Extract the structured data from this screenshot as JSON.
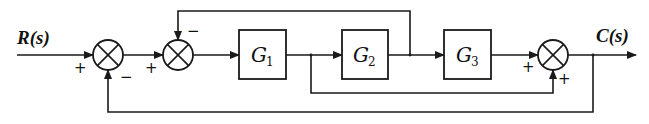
{
  "diagram": {
    "type": "control-system block diagram",
    "input_signal": "R(s)",
    "output_signal": "C(s)",
    "blocks": [
      {
        "id": "G1",
        "label": "G",
        "subscript": "1"
      },
      {
        "id": "G2",
        "label": "G",
        "subscript": "2"
      },
      {
        "id": "G3",
        "label": "G",
        "subscript": "3"
      }
    ],
    "summing_junctions": [
      {
        "id": "sum1",
        "signs": {
          "left": "+",
          "bottom": "−"
        }
      },
      {
        "id": "sum2",
        "signs": {
          "left": "+",
          "top": "−"
        }
      },
      {
        "id": "sum3",
        "signs": {
          "left": "+",
          "bottom": "+"
        }
      }
    ],
    "connections": [
      "R(s) → sum1 (+)",
      "sum1 → sum2 (+)",
      "sum2 → G1",
      "G1 → G2",
      "G1 output → sum3 bottom (+) [feed-forward]",
      "G2 → G3",
      "G2 output → sum2 top (−) [feedback]",
      "G3 → sum3 (+)",
      "sum3 → C(s)",
      "C(s) → sum1 bottom (−) [unity feedback]"
    ],
    "colors": {
      "line": "#1a1a1a",
      "background": "#ffffff"
    }
  }
}
